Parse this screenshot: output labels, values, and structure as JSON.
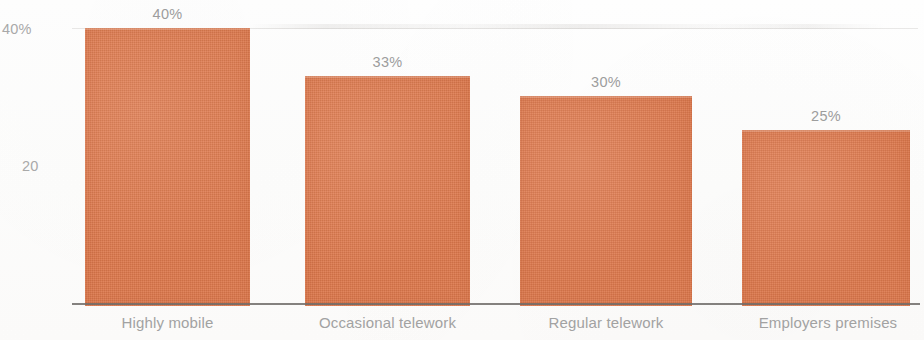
{
  "chart_data": {
    "type": "bar",
    "title": "",
    "subtitle": "",
    "xlabel": "",
    "ylabel": "",
    "categories": [
      "Highly mobile",
      "Occasional telework",
      "Regular telework",
      "Employers premises"
    ],
    "values": [
      40,
      33,
      30,
      25
    ],
    "value_labels": [
      "40%",
      "33%",
      "30%",
      "25%"
    ],
    "ylim": [
      0,
      43
    ],
    "y_ticks": [
      {
        "value": 40,
        "label": "40%"
      },
      {
        "value": 20,
        "label": "20"
      }
    ],
    "grid": "horizontal-faint-at-40",
    "legend": "none",
    "series": [
      {
        "name": "Share of workers",
        "values": [
          40,
          33,
          30,
          25
        ]
      }
    ],
    "colors": {
      "bar": "#e0794c",
      "axis_line": "#6e6b68",
      "tick_text": "#a9a9a9",
      "value_text": "#9d9d9d",
      "category_text": "#a2a2a2",
      "gridline": "#c8c4c0",
      "background": "#ffffff"
    },
    "bars": [
      {
        "category": "Highly mobile",
        "value": 40,
        "label": "40%",
        "left": 85,
        "width": 165,
        "top": 28
      },
      {
        "category": "Occasional telework",
        "value": 33,
        "label": "33%",
        "left": 305,
        "width": 165,
        "top": 76
      },
      {
        "category": "Regular telework",
        "value": 30,
        "label": "30%",
        "left": 520,
        "width": 172,
        "top": 96
      },
      {
        "category": "Employers premises",
        "value": 25,
        "label": "25%",
        "left": 742,
        "width": 168,
        "top": 130
      }
    ]
  }
}
